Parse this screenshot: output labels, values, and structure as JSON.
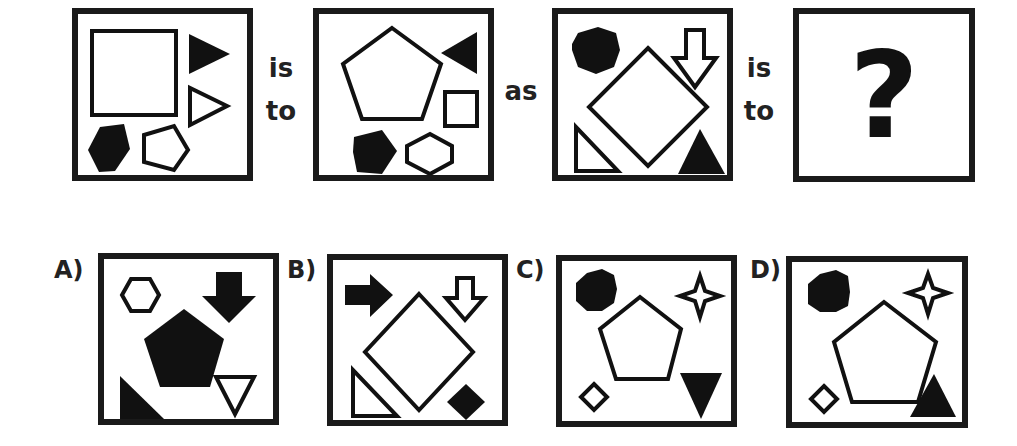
{
  "puzzle": {
    "connectors": {
      "is": "is",
      "to": "to",
      "as": "as"
    },
    "question_mark": "?",
    "top_row": [
      {
        "id": "panel-1",
        "shapes": [
          "large outlined square",
          "filled triangle pointing right",
          "outlined triangle pointing right",
          "filled pentagon",
          "outlined pentagon"
        ]
      },
      {
        "id": "panel-2",
        "shapes": [
          "large outlined pentagon",
          "filled triangle pointing left",
          "small outlined square",
          "filled pentagon",
          "outlined hexagon"
        ]
      },
      {
        "id": "panel-3",
        "shapes": [
          "filled hexagon",
          "outlined down arrow",
          "large outlined diamond",
          "outlined right triangle",
          "filled triangle pointing up"
        ]
      },
      {
        "id": "panel-4",
        "shapes": [
          "question mark"
        ]
      }
    ],
    "options": [
      {
        "label": "A)",
        "shapes": [
          "outlined hexagon",
          "filled down arrow",
          "large filled pentagon",
          "filled right triangle",
          "outlined triangle pointing down"
        ]
      },
      {
        "label": "B)",
        "shapes": [
          "filled right arrow",
          "outlined down arrow",
          "large outlined diamond",
          "outlined right triangle",
          "small filled diamond"
        ]
      },
      {
        "label": "C)",
        "shapes": [
          "filled hexagon",
          "outlined four-point star",
          "outlined pentagon",
          "small outlined diamond",
          "filled triangle pointing down"
        ]
      },
      {
        "label": "D)",
        "shapes": [
          "filled hexagon",
          "outlined four-point star",
          "large outlined pentagon",
          "small outlined diamond",
          "filled triangle pointing up"
        ]
      }
    ]
  }
}
